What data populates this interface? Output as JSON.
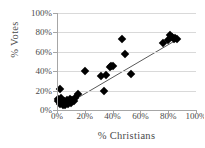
{
  "chart_data": {
    "type": "scatter",
    "title": "",
    "xlabel": "% Christians",
    "ylabel": "% Votes",
    "xlim": [
      0,
      100
    ],
    "ylim": [
      0,
      100
    ],
    "xticks": [
      "0%",
      "20%",
      "40%",
      "60%",
      "80%",
      "100%"
    ],
    "yticks": [
      "0%",
      "20%",
      "40%",
      "60%",
      "80%",
      "100%"
    ],
    "xtick_values": [
      0,
      20,
      40,
      60,
      80,
      100
    ],
    "ytick_values": [
      0,
      20,
      40,
      60,
      80,
      100
    ],
    "grid": "horizontal",
    "legend": "none",
    "marker": "filled-diamond",
    "marker_color": "#000000",
    "trendline": {
      "visible": true,
      "color": "#595959",
      "x_start": 6,
      "y_start": 5,
      "x_end": 88,
      "y_end": 74
    },
    "points": [
      {
        "x": 1,
        "y": 9
      },
      {
        "x": 1,
        "y": 11
      },
      {
        "x": 2,
        "y": 22
      },
      {
        "x": 2,
        "y": 6
      },
      {
        "x": 3,
        "y": 8
      },
      {
        "x": 3,
        "y": 12
      },
      {
        "x": 4,
        "y": 5
      },
      {
        "x": 4,
        "y": 7
      },
      {
        "x": 5,
        "y": 6
      },
      {
        "x": 5,
        "y": 9
      },
      {
        "x": 6,
        "y": 5
      },
      {
        "x": 7,
        "y": 7
      },
      {
        "x": 7,
        "y": 10
      },
      {
        "x": 8,
        "y": 6
      },
      {
        "x": 9,
        "y": 8
      },
      {
        "x": 9,
        "y": 11
      },
      {
        "x": 10,
        "y": 7
      },
      {
        "x": 11,
        "y": 10
      },
      {
        "x": 12,
        "y": 9
      },
      {
        "x": 13,
        "y": 12
      },
      {
        "x": 15,
        "y": 16
      },
      {
        "x": 20,
        "y": 40
      },
      {
        "x": 32,
        "y": 35
      },
      {
        "x": 34,
        "y": 20
      },
      {
        "x": 35,
        "y": 36
      },
      {
        "x": 38,
        "y": 44
      },
      {
        "x": 39,
        "y": 45
      },
      {
        "x": 40,
        "y": 45
      },
      {
        "x": 47,
        "y": 73
      },
      {
        "x": 49,
        "y": 58
      },
      {
        "x": 53,
        "y": 37
      },
      {
        "x": 76,
        "y": 69
      },
      {
        "x": 80,
        "y": 72
      },
      {
        "x": 81,
        "y": 77
      },
      {
        "x": 83,
        "y": 75
      },
      {
        "x": 84,
        "y": 73
      },
      {
        "x": 85,
        "y": 74
      },
      {
        "x": 86,
        "y": 73
      }
    ]
  }
}
